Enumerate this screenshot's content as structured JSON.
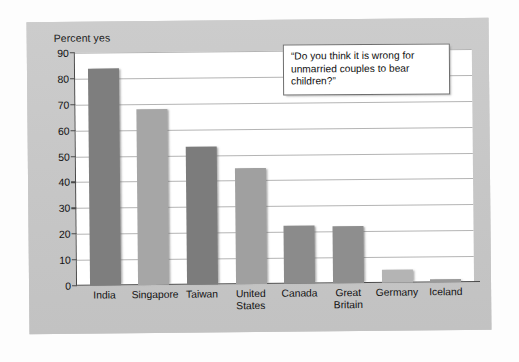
{
  "chart_data": {
    "type": "bar",
    "title": "",
    "subtitle": "",
    "xlabel": "",
    "ylabel": "Percent yes",
    "ylim": [
      0,
      90
    ],
    "yticks": [
      0,
      10,
      20,
      30,
      40,
      50,
      60,
      70,
      80,
      90
    ],
    "grid": true,
    "legend": null,
    "categories": [
      "India",
      "Singapore",
      "Taiwan",
      "United\nStates",
      "Canada",
      "Great\nBritain",
      "Germany",
      "Iceland"
    ],
    "values": [
      84,
      68,
      53.5,
      45,
      22.5,
      22,
      5,
      1
    ],
    "bar_colors": [
      "#7e7e7e",
      "#a6a6a6",
      "#7c7c7c",
      "#a0a0a0",
      "#8b8b8b",
      "#8e8e8e",
      "#b4b4b4",
      "#9a9a9a"
    ],
    "annotations": [
      {
        "name": "question-callout",
        "text": "“Do you think it is wrong for unmarried couples to bear children?”"
      }
    ]
  },
  "colors": {
    "panel_background": "#c9c9c9",
    "plot_background": "#ffffff",
    "axis": "#4a4a4a",
    "gridline": "#b4b4b4",
    "text": "#111111",
    "callout_border": "#6e6e6e"
  }
}
